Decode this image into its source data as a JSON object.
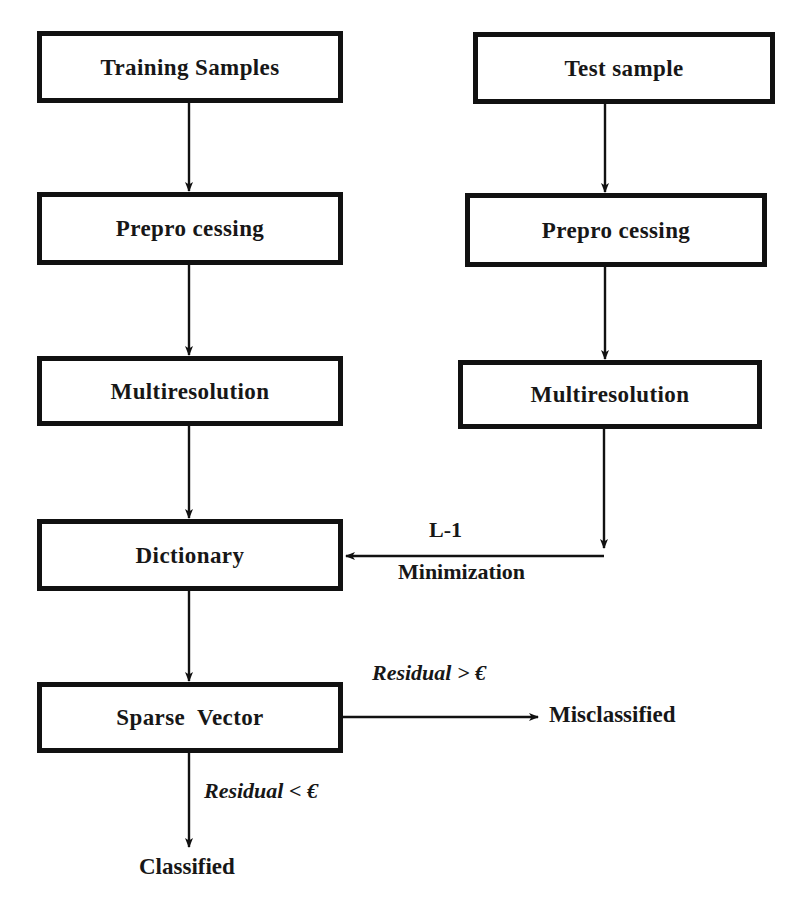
{
  "diagram": {
    "background_color": "#ffffff",
    "stroke_color": "#111111",
    "text_color": "#171717"
  },
  "nodes": {
    "training_samples": "Training Samples",
    "test_sample": "Test sample",
    "preprocessing_left": "Prepro cessing",
    "preprocessing_right": "Prepro cessing",
    "multiresolution_left": "Multiresolution",
    "multiresolution_right": "Multiresolution",
    "dictionary": "Dictionary",
    "sparse_vector": "Sparse  Vector"
  },
  "terminals": {
    "misclassified": "Misclassified",
    "classified": "Classified"
  },
  "edge_labels": {
    "l1": "L-1",
    "minimization": "Minimization",
    "residual_greater": "Residual > €",
    "residual_less": "Residual < €"
  }
}
